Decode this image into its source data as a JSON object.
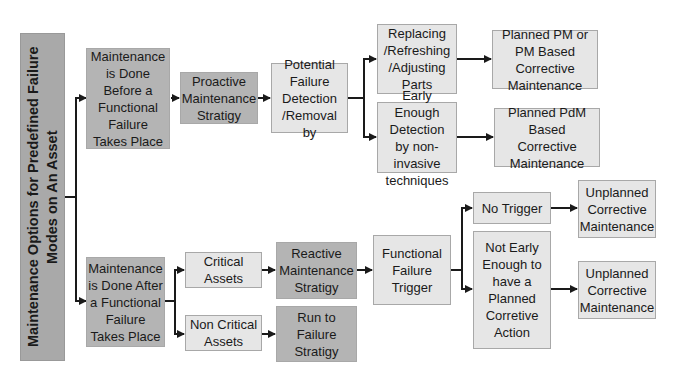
{
  "diagram": {
    "root": "Maintenance Options for Predefined Failure Modes on An Asset",
    "nodes": {
      "before": "Maintenance is Done Before a Functional Failure Takes Place",
      "proactive": "Proactive Maintenance Stratigy",
      "potential": "Potential Failure Detection /Removal  by",
      "replacing": "Replacing /Refreshing /Adjusting Parts",
      "early": "Early Enough Detection by non-invasive techniques",
      "planned_pm": "Planned PM or PM Based Corrective Maintenance",
      "planned_pdm": "Planned PdM Based Corrective Maintenance",
      "after": "Maintenance is Done After a Functional Failure Takes Place",
      "critical": "Critical Assets",
      "non_critical": "Non Critical Assets",
      "reactive": "Reactive Maintenance Stratigy",
      "run_to_failure": "Run to Failure Stratigy",
      "functional_trigger": "Functional Failure Trigger",
      "no_trigger": "No Trigger",
      "not_early": "Not Early Enough to have a Planned Corretive Action",
      "unplanned_1": "Unplanned Corrective Maintenance",
      "unplanned_2": "Unplanned Corrective Maintenance"
    },
    "colors": {
      "light_fill": "#e6e6e6",
      "mid_fill": "#c8c8c8",
      "dark_fill": "#b4b4b4",
      "root_fill": "#a9a9a9",
      "connector": "#1a1a1a"
    }
  }
}
